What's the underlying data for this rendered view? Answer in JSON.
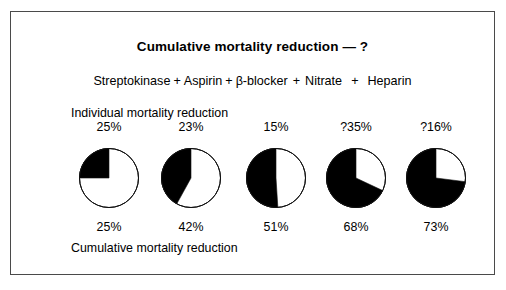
{
  "figure": {
    "title": "Cumulative mortality reduction — ?",
    "individual_caption": "Individual mortality reduction",
    "cumulative_caption": "Cumulative mortality reduction",
    "plus_symbol": "+",
    "border_color": "#4a4a4a",
    "fill_color": "#000000",
    "background_color": "#ffffff"
  },
  "regimen": {
    "drugs": [
      {
        "name": "Streptokinase"
      },
      {
        "name": "Aspirin"
      },
      {
        "name": "β-blocker"
      },
      {
        "name": "Nitrate"
      },
      {
        "name": "Heparin"
      }
    ]
  },
  "individual_labels": [
    "25%",
    "23%",
    "15%",
    "?35%",
    "?16%"
  ],
  "cumulative_labels": [
    "25%",
    "42%",
    "51%",
    "68%",
    "73%"
  ],
  "chart_data": {
    "type": "pie",
    "title": "Cumulative mortality reduction — ?",
    "xlabel": "",
    "ylabel": "",
    "legend": [],
    "grid": false,
    "series": [
      {
        "name": "Individual mortality reduction",
        "categories": [
          "Streptokinase",
          "Aspirin",
          "β-blocker",
          "Nitrate",
          "Heparin"
        ],
        "values": [
          25,
          23,
          15,
          35,
          16
        ],
        "labels": [
          "25%",
          "23%",
          "15%",
          "?35%",
          "?16%"
        ],
        "uncertain": [
          false,
          false,
          false,
          true,
          true
        ]
      },
      {
        "name": "Cumulative mortality reduction",
        "categories": [
          "Streptokinase",
          "+ Aspirin",
          "+ β-blocker",
          "+ Nitrate",
          "+ Heparin"
        ],
        "values": [
          25,
          42,
          51,
          68,
          73
        ],
        "labels": [
          "25%",
          "42%",
          "51%",
          "68%",
          "73%"
        ],
        "slice_filled_color": "#000000",
        "slice_empty_color": "#ffffff"
      }
    ],
    "pies": [
      {
        "label": "25%",
        "filled_percent": 25,
        "direction": "counterclockwise",
        "start_angle_deg": 0
      },
      {
        "label": "42%",
        "filled_percent": 42,
        "direction": "counterclockwise",
        "start_angle_deg": 0
      },
      {
        "label": "51%",
        "filled_percent": 51,
        "direction": "counterclockwise",
        "start_angle_deg": 0
      },
      {
        "label": "68%",
        "filled_percent": 68,
        "direction": "counterclockwise",
        "start_angle_deg": 0
      },
      {
        "label": "73%",
        "filled_percent": 73,
        "direction": "counterclockwise",
        "start_angle_deg": 0
      }
    ]
  },
  "layout": {
    "column_centers_px": [
      98,
      180,
      265,
      345,
      425
    ]
  }
}
